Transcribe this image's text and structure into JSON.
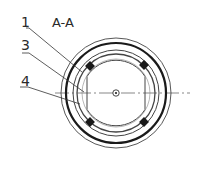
{
  "diagram": {
    "section_label": "A-A",
    "part_labels": [
      {
        "id": "1",
        "text": "1"
      },
      {
        "id": "3",
        "text": "3"
      },
      {
        "id": "4",
        "text": "4"
      }
    ],
    "colors": {
      "line": "#2a2a2a",
      "thick_line": "#1a1a1a",
      "background": "#ffffff"
    }
  }
}
